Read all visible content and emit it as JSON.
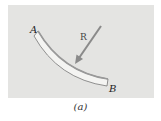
{
  "figure": {
    "caption": "(a)",
    "labels": {
      "start_point": "A",
      "end_point": "B",
      "force": "R"
    },
    "colors": {
      "panel": "#e4e4e2",
      "beam_fill": "#f4f4f2",
      "beam_stroke": "#777777",
      "arrow": "#8a8a8a"
    }
  }
}
